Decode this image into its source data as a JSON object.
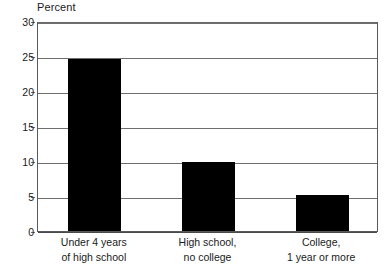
{
  "chart_data": {
    "type": "bar",
    "title": "",
    "xlabel": "",
    "ylabel": "Percent",
    "ylim": [
      0,
      30
    ],
    "yticks": [
      0,
      5,
      10,
      15,
      20,
      25,
      30
    ],
    "ytick_labels": [
      "0",
      "5",
      "10",
      "15",
      "20",
      "25",
      "30"
    ],
    "grid": true,
    "legend": false,
    "bar_color": "#000000",
    "categories": [
      "Under 4 years of high school",
      "High school, no college",
      "College, 1 year or more"
    ],
    "category_lines": [
      [
        "Under 4 years",
        "of high school"
      ],
      [
        "High school,",
        "no college"
      ],
      [
        "College,",
        "1 year or more"
      ]
    ],
    "values": [
      24.6,
      9.8,
      5.2
    ]
  }
}
